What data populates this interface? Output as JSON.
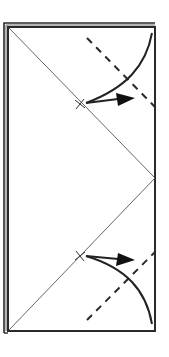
{
  "diagram": {
    "type": "origami-fold-instruction",
    "background": "#ffffff",
    "line_color": "#2a2a2a",
    "crease_color": "#555555",
    "paper": {
      "left": 8,
      "top": 26,
      "right": 155,
      "bottom": 331,
      "layered_edges": [
        "left",
        "top"
      ]
    },
    "crease_diagonals": [
      {
        "from": [
          8,
          27
        ],
        "to": [
          155,
          178
        ]
      },
      {
        "from": [
          155,
          178
        ],
        "to": [
          8,
          331
        ]
      }
    ],
    "reference_marks": [
      {
        "name": "upper-x-mark",
        "at": [
          80,
          104
        ]
      },
      {
        "name": "lower-x-mark",
        "at": [
          80,
          256
        ]
      }
    ],
    "valley_fold_lines": [
      {
        "name": "upper-valley-fold",
        "from": [
          87,
          38
        ],
        "to": [
          155,
          107
        ]
      },
      {
        "name": "lower-valley-fold",
        "from": [
          87,
          320
        ],
        "to": [
          155,
          252
        ]
      }
    ],
    "fold_arrows": [
      {
        "name": "upper-fold-arrow",
        "direction": "corner-to-x-mark"
      },
      {
        "name": "lower-fold-arrow",
        "direction": "corner-to-x-mark"
      }
    ]
  }
}
